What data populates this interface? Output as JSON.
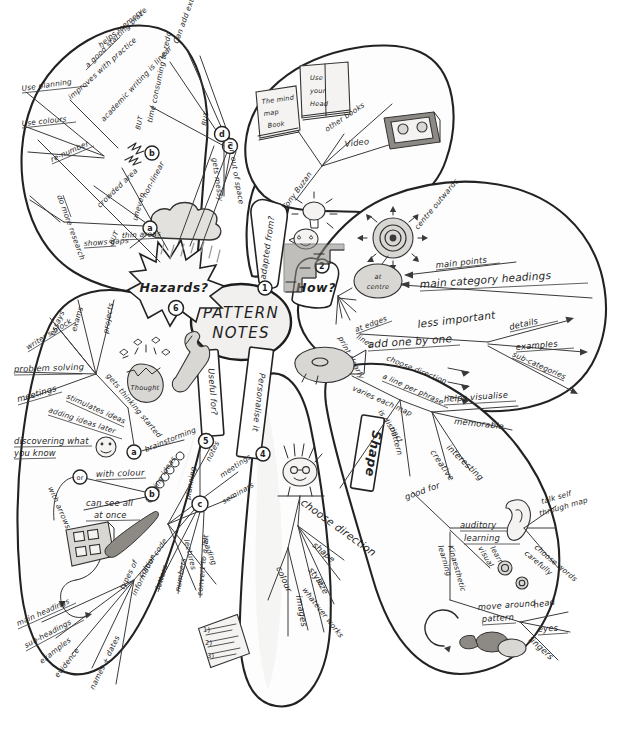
{
  "document": {
    "type": "hand-drawn mind map",
    "title": "PATTERN NOTES",
    "background_color": "#ffffff",
    "ink_color": "#2b2b2b"
  },
  "centre": {
    "line1": "PATTERN",
    "line2": "NOTES"
  },
  "sections": [
    {
      "number": "1",
      "label": "adapted from?"
    },
    {
      "number": "2",
      "label": "How?"
    },
    {
      "number": "3",
      "label": "Shape"
    },
    {
      "number": "4",
      "label": "Personalise it"
    },
    {
      "number": "5",
      "label": "Useful for?"
    },
    {
      "number": "6",
      "label": "Hazards?"
    }
  ],
  "adapted_from": {
    "title": "adapted from?",
    "number": "1",
    "author": "Tony Buzan",
    "sources": [
      "The mind map Book",
      "Use your Head",
      "other books",
      "Video"
    ],
    "icons": [
      "book-icon",
      "book-icon",
      "lightbulb-icon",
      "face-icon",
      "video-cassette-icon"
    ]
  },
  "how": {
    "title": "How?",
    "number": "2",
    "direction": "centre outwards",
    "levels": [
      {
        "position": "at centre",
        "items": [
          "main points",
          "main category headings"
        ]
      },
      {
        "position": "at edges",
        "items": [
          "less important"
        ]
      }
    ],
    "technique": [
      "print clearly",
      "lines",
      "add one by one",
      "choose direction",
      "a line per phrase"
    ],
    "detail_branch": [
      "details",
      "examples",
      "sub-categories"
    ],
    "icons": [
      "target-radial-icon",
      "stairs-icon"
    ]
  },
  "shape": {
    "title": "Shape",
    "number": "3",
    "attributes": [
      "varies each map",
      "is distinct",
      "pattern"
    ],
    "good_for_label": "good for",
    "benefits": [
      "helps visualise",
      "memorable",
      "interesting",
      "creative"
    ],
    "learning_styles": [
      {
        "name": "auditory learning",
        "icon": "ear-icon",
        "items": [
          "talk self through map",
          "choose words carefully"
        ]
      },
      {
        "name": "visual learning",
        "icon": "eye-icon",
        "items": []
      },
      {
        "name": "kinaesthetic learning",
        "icon": "hand-icon",
        "items": [
          "move around pattern",
          "head",
          "eyes",
          "fingers"
        ]
      }
    ],
    "icons": [
      "fish-icon",
      "circle-arrow-icon"
    ]
  },
  "personalise": {
    "title": "Personalise it",
    "number": "4",
    "choose_label": "choose direction",
    "choices": [
      "shape",
      "style",
      "whatever works"
    ],
    "elements": [
      "colour",
      "images",
      "size"
    ],
    "icons": [
      "punk-face-icon"
    ]
  },
  "useful_for": {
    "title": "Useful for?",
    "number": "5",
    "node_a": "a",
    "node_b": "b",
    "node_c": "c",
    "uses": [
      "essays",
      "exams",
      "projects",
      "writer's block",
      "problem solving",
      "meetings",
      "discovering what you know"
    ],
    "thinking": [
      "gets thinking started",
      "stimulates ideas",
      "adding ideas later"
    ],
    "thought_bubble": "Thought",
    "brainstorming": "brainstorming",
    "linking_ideas": "linking ideas",
    "planning": "planning",
    "notes_label": "notes",
    "notes_items": [
      "meetings",
      "seminars",
      "lectures",
      "reading"
    ],
    "colour_branch": {
      "or_label": "or",
      "with_colour": "with colour",
      "with_arrows": "with arrows",
      "see_all": "can see all at once",
      "colour_code": "colour code",
      "codes": [
        "letters",
        "numbers"
      ],
      "convert": "convert to a list"
    },
    "types_of_information": {
      "label": "types of information",
      "items": [
        "main headings",
        "sub-headings",
        "examples",
        "evidence",
        "names + dates"
      ]
    },
    "icons": [
      "spanner-icon",
      "egg-thought-icon",
      "smiley-icon",
      "paintbrush-icon",
      "paint-palette-icon",
      "numbered-list-icon",
      "chain-link-icon"
    ]
  },
  "hazards": {
    "title": "Hazards?",
    "number": "6",
    "node_a": "a",
    "node_b": "b",
    "node_c": "c",
    "node_d": "d",
    "but_label": "BUT",
    "items": [
      "a good starting place",
      "Use planning",
      "Use colours",
      "re-number",
      "do more research",
      "shows gaps",
      "thin areas",
      "crowded area",
      "uneven",
      "non-linear",
      "academic writing is linear",
      "improves with practice",
      "helps memory",
      "time consuming to redo",
      "Can add extra sheets",
      "gets messy",
      "run out of space"
    ],
    "icons": [
      "rain-cloud-icon",
      "starburst-icon",
      "lightning-icon"
    ]
  }
}
